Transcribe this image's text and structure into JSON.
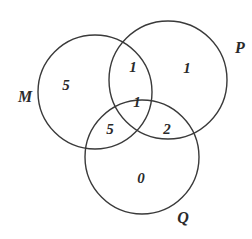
{
  "diagram": {
    "type": "venn",
    "sets": [
      {
        "id": "M",
        "label": "M",
        "cx": 95,
        "cy": 92,
        "r": 57,
        "label_x": 25,
        "label_y": 102
      },
      {
        "id": "P",
        "label": "P",
        "cx": 168,
        "cy": 80,
        "r": 59,
        "label_x": 240,
        "label_y": 53
      },
      {
        "id": "Q",
        "label": "Q",
        "cx": 142,
        "cy": 157,
        "r": 57,
        "label_x": 183,
        "label_y": 223
      }
    ],
    "regions": [
      {
        "sets": "M only",
        "value": "5",
        "x": 66,
        "y": 90
      },
      {
        "sets": "M∩P only",
        "value": "1",
        "x": 133,
        "y": 72
      },
      {
        "sets": "P only",
        "value": "1",
        "x": 187,
        "y": 73
      },
      {
        "sets": "M∩P∩Q",
        "value": "1",
        "x": 137,
        "y": 107
      },
      {
        "sets": "M∩Q only",
        "value": "5",
        "x": 110,
        "y": 134
      },
      {
        "sets": "P∩Q only",
        "value": "2",
        "x": 167,
        "y": 134
      },
      {
        "sets": "Q only",
        "value": "0",
        "x": 141,
        "y": 183
      }
    ]
  }
}
